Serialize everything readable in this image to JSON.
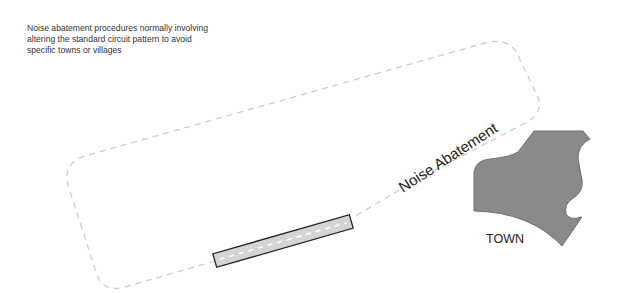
{
  "caption": {
    "line1": "Noise abatement procedures normally involving",
    "line2": "altering the standard circuit pattern to avoid",
    "line3": "specific towns or villages"
  },
  "labels": {
    "noise_abatement": "Noise Abatement",
    "town": "TOWN"
  },
  "colors": {
    "circuit": "#cccccc",
    "runway_fill": "#d4d4d4",
    "runway_stroke": "#222222",
    "centerline": "#ffffff",
    "town_fill": "#8a8a8a",
    "town_stroke": "#666666"
  }
}
